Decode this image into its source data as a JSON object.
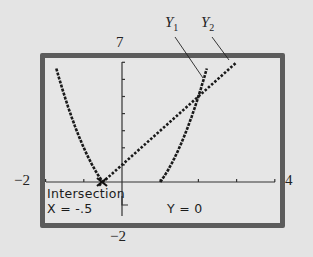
{
  "chart_data": {
    "type": "line",
    "title": "",
    "xlabel": "",
    "ylabel": "",
    "xlim": [
      -2,
      4
    ],
    "ylim": [
      -2,
      7
    ],
    "x_tick_spacing": 1,
    "y_tick_spacing": 1,
    "grid": false,
    "window_labels": {
      "xmin": "−2",
      "xmax": "4",
      "ymin": "−2",
      "ymax": "7"
    },
    "series": [
      {
        "name": "Y1",
        "label": "Y",
        "subscript": "1",
        "equation": "y = 2x^2 - x - 1",
        "points": [
          [
            -1.7,
            6.48
          ],
          [
            -1.5,
            4.0
          ],
          [
            -1.0,
            2.0
          ],
          [
            -0.5,
            0.0
          ],
          [
            1.0,
            0.0
          ],
          [
            1.5,
            2.0
          ],
          [
            2.0,
            5.0
          ],
          [
            2.2,
            6.48
          ]
        ]
      },
      {
        "name": "Y2",
        "label": "Y",
        "subscript": "2",
        "equation": "y = 2x + 1",
        "points": [
          [
            -0.5,
            0.0
          ],
          [
            0.0,
            1.0
          ],
          [
            1.0,
            3.0
          ],
          [
            2.0,
            5.0
          ],
          [
            3.0,
            7.0
          ]
        ]
      }
    ],
    "intersections": [
      [
        -0.5,
        0.0
      ],
      [
        2.0,
        5.0
      ]
    ],
    "annotations": [
      {
        "text": "Intersection",
        "position": "bottom-left"
      },
      {
        "text": "X = -.5",
        "position": "bottom-left"
      },
      {
        "text": "Y = 0",
        "position": "bottom-center"
      }
    ],
    "legend": "callout labels Y1 and Y2 at top right"
  },
  "screen": {
    "title": "Intersection",
    "x_readout": "X = -.5",
    "y_readout": "Y = 0"
  },
  "labels": {
    "xmin": "−2",
    "xmax": "4",
    "ymin": "−2",
    "ymax": "7",
    "y1_main": "Y",
    "y1_sub": "1",
    "y2_main": "Y",
    "y2_sub": "2"
  },
  "colors": {
    "background": "#e4e4e4",
    "screen": "#e6e6e6",
    "frame": "#5c5c5c",
    "curve": "#1a1a1a"
  }
}
